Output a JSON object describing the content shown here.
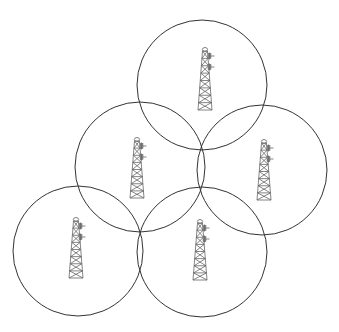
{
  "diagram": {
    "title": "",
    "width": 339,
    "height": 332,
    "colors": {
      "background": "#ffffff",
      "circle_stroke": "#333333",
      "tower_stroke": "#666666"
    },
    "cells": [
      {
        "id": "top",
        "cx": 202,
        "cy": 85,
        "r": 65,
        "tower": {
          "x": 205,
          "top": 48,
          "height": 62
        }
      },
      {
        "id": "middle-left",
        "cx": 140,
        "cy": 167,
        "r": 65,
        "tower": {
          "x": 137,
          "top": 138,
          "height": 60
        }
      },
      {
        "id": "middle-right",
        "cx": 262,
        "cy": 170,
        "r": 65,
        "tower": {
          "x": 264,
          "top": 140,
          "height": 60
        }
      },
      {
        "id": "bottom-left",
        "cx": 78,
        "cy": 251,
        "r": 65,
        "tower": {
          "x": 76,
          "top": 218,
          "height": 60
        }
      },
      {
        "id": "bottom-center",
        "cx": 202,
        "cy": 252,
        "r": 65,
        "tower": {
          "x": 200,
          "top": 220,
          "height": 60
        }
      }
    ],
    "icon": "cell-tower-icon"
  }
}
